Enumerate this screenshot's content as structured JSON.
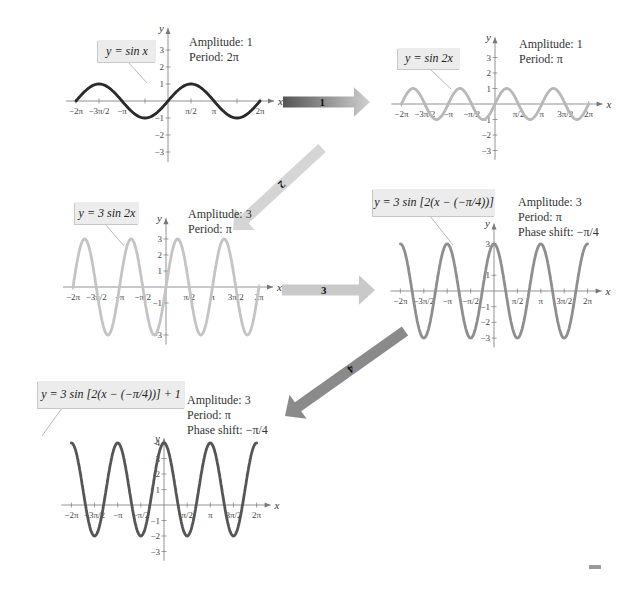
{
  "graphs": [
    {
      "id": "g1",
      "equation": "y = sin x",
      "info": [
        "Amplitude: 1",
        "Period: 2π"
      ],
      "color": "#2a2a2a",
      "A": 1,
      "B": 1,
      "C": 0,
      "D": 0,
      "origin": [
        168,
        101
      ],
      "px_per_pi": 46,
      "px_per_unit": 17,
      "xticks": [
        "−2π",
        "−3π/2",
        "−π",
        "π/2",
        "π",
        "2π"
      ],
      "yticks": [
        "3",
        "2",
        "1",
        "−1",
        "−2",
        "−3"
      ]
    },
    {
      "id": "g2",
      "equation": "y = sin 2x",
      "info": [
        "Amplitude: 1",
        "Period: π"
      ],
      "color": "#b8b8b8",
      "A": 1,
      "B": 2,
      "C": 0,
      "D": 0,
      "origin": [
        495,
        104
      ],
      "px_per_pi": 46.8,
      "px_per_unit": 15.5,
      "xticks": [
        "−2π",
        "−3π/2",
        "−π",
        "−π/2",
        "π/2",
        "π",
        "3π/2",
        "2π"
      ],
      "yticks": [
        "3",
        "2",
        "1",
        "−1",
        "−2",
        "−3"
      ]
    },
    {
      "id": "g3",
      "equation": "y = 3 sin 2x",
      "info": [
        "Amplitude: 3",
        "Period: π"
      ],
      "color": "#c4c4c4",
      "A": 3,
      "B": 2,
      "C": 0,
      "D": 0,
      "origin": [
        166,
        287
      ],
      "px_per_pi": 46.5,
      "px_per_unit": 16,
      "xticks": [
        "−2π",
        "−3π/2",
        "−π",
        "−π/2",
        "π/2",
        "π",
        "3π/2",
        "2π"
      ],
      "yticks": [
        "3",
        "2",
        "1",
        "−1",
        "−3"
      ]
    },
    {
      "id": "g4",
      "equation": "y = 3 sin [2(x − (−π/4))]",
      "info": [
        "Amplitude: 3",
        "Period: π",
        "Phase shift: −π/4"
      ],
      "color": "#8e8e8e",
      "A": 3,
      "B": 2,
      "C": -0.25,
      "D": 0,
      "origin": [
        494,
        291
      ],
      "px_per_pi": 46.8,
      "px_per_unit": 15.7,
      "xticks": [
        "−2π",
        "−3π/2",
        "−π",
        "−π/2",
        "π/2",
        "π",
        "3π/2",
        "2π"
      ],
      "yticks": [
        "3",
        "1",
        "−1",
        "−2",
        "−3"
      ]
    },
    {
      "id": "g5",
      "equation": "y = 3 sin [2(x − (−π/4))] + 1",
      "info": [
        "Amplitude: 3",
        "Period: π",
        "Phase shift: −π/4"
      ],
      "color": "#555555",
      "A": 3,
      "B": 2,
      "C": -0.25,
      "D": 1,
      "origin": [
        164,
        505
      ],
      "px_per_pi": 46.3,
      "px_per_unit": 15.5,
      "xticks": [
        "−2π",
        "−3π/2",
        "−π",
        "−π/2",
        "π/2",
        "π",
        "3π/2",
        "2π"
      ],
      "yticks": [
        "4",
        "3",
        "2",
        "1",
        "−1",
        "−2",
        "−3"
      ]
    }
  ],
  "arrows": [
    {
      "label": "1",
      "from": "g1",
      "to": "g2"
    },
    {
      "label": "2",
      "from": "g2",
      "to": "g3"
    },
    {
      "label": "3",
      "from": "g3",
      "to": "g4"
    },
    {
      "label": "4",
      "from": "g4",
      "to": "g5"
    }
  ],
  "axis_labels": {
    "x": "x",
    "y": "y"
  },
  "chart_data": [
    {
      "type": "line",
      "title": "y = sin x",
      "xlabel": "x",
      "ylabel": "y",
      "xlim": [
        -6.283,
        6.283
      ],
      "ylim": [
        -3,
        3
      ],
      "amplitude": 1,
      "period": "2π",
      "function": "sin(x)"
    },
    {
      "type": "line",
      "title": "y = sin 2x",
      "xlabel": "x",
      "ylabel": "y",
      "xlim": [
        -6.283,
        6.283
      ],
      "ylim": [
        -3,
        3
      ],
      "amplitude": 1,
      "period": "π",
      "function": "sin(2x)"
    },
    {
      "type": "line",
      "title": "y = 3 sin 2x",
      "xlabel": "x",
      "ylabel": "y",
      "xlim": [
        -6.283,
        6.283
      ],
      "ylim": [
        -3,
        3
      ],
      "amplitude": 3,
      "period": "π",
      "function": "3sin(2x)"
    },
    {
      "type": "line",
      "title": "y = 3 sin [2(x − (−π/4))]",
      "xlabel": "x",
      "ylabel": "y",
      "xlim": [
        -6.283,
        6.283
      ],
      "ylim": [
        -3,
        3
      ],
      "amplitude": 3,
      "period": "π",
      "phase_shift": "−π/4",
      "function": "3sin(2(x+π/4))"
    },
    {
      "type": "line",
      "title": "y = 3 sin [2(x − (−π/4))] + 1",
      "xlabel": "x",
      "ylabel": "y",
      "xlim": [
        -6.283,
        6.283
      ],
      "ylim": [
        -3,
        4
      ],
      "amplitude": 3,
      "period": "π",
      "phase_shift": "−π/4",
      "vertical_shift": 1,
      "function": "3sin(2(x+π/4))+1"
    }
  ]
}
